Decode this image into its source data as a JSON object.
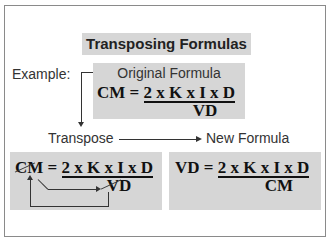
{
  "title": "Transposing Formulas",
  "example_label": "Example:",
  "original": {
    "label": "Original Formula",
    "lhs": "CM =",
    "numerator": "2 x K x I x D",
    "denominator": "VD"
  },
  "transpose_label": "Transpose",
  "new_formula_label": "New Formula",
  "transpose_example": {
    "lhs": "CM =",
    "numerator": "2 x K x I x D",
    "denominator": "VD"
  },
  "new_formula": {
    "lhs": "VD =",
    "numerator": "2 x K x I x D",
    "denominator": "CM"
  }
}
